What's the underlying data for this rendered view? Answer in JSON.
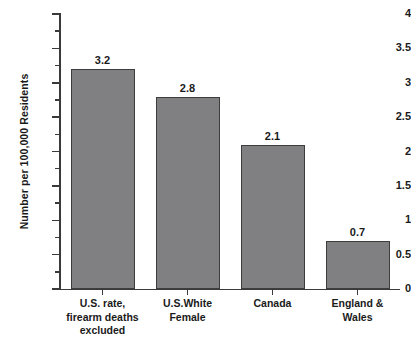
{
  "chart_data": {
    "type": "bar",
    "title": "",
    "xlabel": "",
    "ylabel": "Number per 100,000 Residents",
    "ylim": [
      0,
      4
    ],
    "grid": false,
    "legend": "none",
    "orientation": "vertical",
    "bar_color": "#808083",
    "bar_edge_color": "#3d3d3d",
    "axis_color": "#3a3a3a",
    "background_color": "#ffffff",
    "categories": [
      "U.S. rate,\nfirearm deaths\nexcluded",
      "U.S.White\nFemale",
      "Canada",
      "England &\nWales"
    ],
    "values": [
      3.2,
      2.8,
      2.1,
      0.7
    ],
    "value_labels": [
      "3.2",
      "2.8",
      "2.1",
      "0.7"
    ],
    "y_major_ticks": [
      0,
      0.5,
      1,
      1.5,
      2,
      2.5,
      3,
      3.5,
      4
    ],
    "y_major_tick_labels": [
      "0",
      "0.5",
      "1",
      "1.5",
      "2",
      "2.5",
      "3",
      "3.5",
      "4"
    ],
    "y_minor_tick_step": 0.25
  }
}
